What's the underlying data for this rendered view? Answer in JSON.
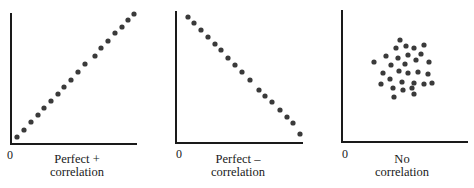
{
  "colors": {
    "axis": "#1a1a1a",
    "dot": "#3a3a3a",
    "text": "#1a1a1a",
    "background": "#ffffff"
  },
  "chart_data": [
    {
      "type": "scatter",
      "title": "Perfect + correlation",
      "caption_lines": [
        "Perfect +",
        "correlation"
      ],
      "origin_label": "0",
      "xlabel": "",
      "ylabel": "",
      "grid": false,
      "axes_px": {
        "x0": 11,
        "x1": 137,
        "y0": 13,
        "y1": 144
      },
      "points": [
        [
          17,
          137
        ],
        [
          24,
          130
        ],
        [
          31,
          122
        ],
        [
          38,
          115
        ],
        [
          44,
          108
        ],
        [
          51,
          101
        ],
        [
          58,
          94
        ],
        [
          64,
          87
        ],
        [
          71,
          80
        ],
        [
          78,
          72
        ],
        [
          85,
          64
        ],
        [
          95,
          56
        ],
        [
          101,
          48
        ],
        [
          108,
          41
        ],
        [
          115,
          33
        ],
        [
          122,
          27
        ],
        [
          128,
          20
        ],
        [
          134,
          14
        ]
      ]
    },
    {
      "type": "scatter",
      "title": "Perfect – correlation",
      "caption_lines": [
        "Perfect –",
        "correlation"
      ],
      "origin_label": "0",
      "xlabel": "",
      "ylabel": "",
      "grid": false,
      "axes_px": {
        "x0": 176,
        "x1": 303,
        "y0": 11,
        "y1": 143
      },
      "points": [
        [
          188,
          17
        ],
        [
          194,
          23
        ],
        [
          201,
          30
        ],
        [
          208,
          37
        ],
        [
          215,
          44
        ],
        [
          221,
          50
        ],
        [
          228,
          58
        ],
        [
          235,
          65
        ],
        [
          242,
          72
        ],
        [
          250,
          80
        ],
        [
          259,
          90
        ],
        [
          265,
          96
        ],
        [
          272,
          102
        ],
        [
          280,
          110
        ],
        [
          287,
          117
        ],
        [
          293,
          123
        ],
        [
          300,
          134
        ]
      ]
    },
    {
      "type": "scatter",
      "title": "No correlation",
      "caption_lines": [
        "No",
        "correlation"
      ],
      "origin_label": "0",
      "xlabel": "",
      "ylabel": "",
      "grid": false,
      "axes_px": {
        "x0": 342,
        "x1": 468,
        "y0": 10,
        "y1": 142
      },
      "points": [
        [
          400,
          40
        ],
        [
          396,
          48
        ],
        [
          406,
          46
        ],
        [
          414,
          48
        ],
        [
          424,
          45
        ],
        [
          386,
          56
        ],
        [
          398,
          58
        ],
        [
          408,
          55
        ],
        [
          421,
          54
        ],
        [
          374,
          62
        ],
        [
          391,
          65
        ],
        [
          405,
          64
        ],
        [
          416,
          60
        ],
        [
          429,
          62
        ],
        [
          383,
          73
        ],
        [
          399,
          71
        ],
        [
          408,
          73
        ],
        [
          418,
          72
        ],
        [
          428,
          74
        ],
        [
          390,
          79
        ],
        [
          381,
          84
        ],
        [
          402,
          82
        ],
        [
          414,
          83
        ],
        [
          424,
          84
        ],
        [
          432,
          83
        ],
        [
          393,
          88
        ],
        [
          403,
          90
        ],
        [
          412,
          88
        ],
        [
          394,
          97
        ],
        [
          414,
          94
        ]
      ]
    }
  ],
  "panels": [
    {
      "zero": "0",
      "caption1": "Perfect +",
      "caption2": "correlation"
    },
    {
      "zero": "0",
      "caption1": "Perfect –",
      "caption2": "correlation"
    },
    {
      "zero": "0",
      "caption1": "No",
      "caption2": "correlation"
    }
  ]
}
